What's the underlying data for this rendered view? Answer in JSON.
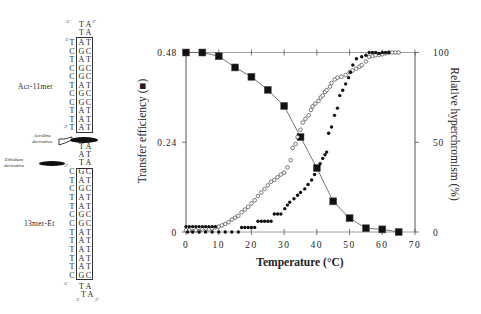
{
  "schematic": {
    "acr_label": "Acr-11mer",
    "et_label": "13mer-Et",
    "acridine_label": [
      "Acridine",
      "derivative"
    ],
    "ethidium_label": [
      "Ethidium",
      "derivative"
    ],
    "prime5": "5'",
    "prime3": "3'",
    "acr_top": [
      [
        "T",
        "A"
      ],
      [
        "T",
        "A"
      ]
    ],
    "acr_rows": [
      [
        "T",
        "A",
        "T"
      ],
      [
        "C",
        "G",
        "C"
      ],
      [
        "T",
        "A",
        "T"
      ],
      [
        "C",
        "G",
        "C"
      ],
      [
        "C",
        "G",
        "C"
      ],
      [
        "T",
        "A",
        "T"
      ],
      [
        "C",
        "G",
        "C"
      ],
      [
        "C",
        "G",
        "C"
      ],
      [
        "T",
        "A",
        "T"
      ],
      [
        "T",
        "A",
        "T"
      ],
      [
        "T",
        "A",
        "T"
      ]
    ],
    "linker": [
      [
        "T",
        "A"
      ],
      [
        "A",
        "T"
      ],
      [
        "T",
        "A"
      ]
    ],
    "et_rows": [
      [
        "C",
        "G",
        "C"
      ],
      [
        "T",
        "A",
        "T"
      ],
      [
        "C",
        "G",
        "C"
      ],
      [
        "T",
        "A",
        "T"
      ],
      [
        "T",
        "A",
        "T"
      ],
      [
        "C",
        "G",
        "C"
      ],
      [
        "C",
        "G",
        "C"
      ],
      [
        "T",
        "A",
        "T"
      ],
      [
        "T",
        "A",
        "T"
      ],
      [
        "T",
        "A",
        "T"
      ],
      [
        "T",
        "A",
        "T"
      ],
      [
        "T",
        "A",
        "T"
      ],
      [
        "C",
        "G",
        "C"
      ]
    ],
    "et_bottom": [
      [
        "T",
        "A"
      ],
      [
        "T",
        "A"
      ]
    ]
  },
  "chart_data": {
    "type": "scatter",
    "title": "",
    "xlabel": "Temperature (°C)",
    "ylabel_left": "Transfer efficiency (■)",
    "ylabel_right": "Relative hyperchromism (%)",
    "xlim": [
      0,
      70
    ],
    "xticks": [
      0,
      10,
      20,
      30,
      40,
      50,
      60,
      70
    ],
    "ylim_left": [
      0,
      0.48
    ],
    "yticks_left": [
      0,
      0.24,
      0.48
    ],
    "yticks_left_labels": [
      "0",
      "0.24",
      "0.48"
    ],
    "ylim_right": [
      0,
      100
    ],
    "yticks_right": [
      0,
      50,
      100
    ],
    "grid": false,
    "series": [
      {
        "name": "Transfer efficiency",
        "marker": "filled-square",
        "axis": "left",
        "line": true,
        "x": [
          0,
          5,
          10,
          15,
          20,
          25,
          30,
          35,
          40,
          45,
          50,
          55,
          60,
          65
        ],
        "y": [
          0.48,
          0.48,
          0.47,
          0.44,
          0.415,
          0.38,
          0.337,
          0.254,
          0.171,
          0.082,
          0.037,
          0.01,
          0.007,
          0.0
        ]
      },
      {
        "name": "Relative hyperchromism (open circles)",
        "marker": "open-circle",
        "axis": "right",
        "line": false,
        "points": [
          [
            0,
            1
          ],
          [
            1,
            1
          ],
          [
            2,
            0.5
          ],
          [
            3,
            1
          ],
          [
            4,
            0.5
          ],
          [
            5,
            1.5
          ],
          [
            6,
            2
          ],
          [
            7,
            1.5
          ],
          [
            8,
            2
          ],
          [
            9,
            2.5
          ],
          [
            10,
            3
          ],
          [
            11,
            3.7
          ],
          [
            12,
            4.5
          ],
          [
            13,
            5.5
          ],
          [
            14,
            7
          ],
          [
            15,
            8
          ],
          [
            16,
            9
          ],
          [
            17,
            11
          ],
          [
            18,
            12.5
          ],
          [
            19,
            14
          ],
          [
            20,
            16
          ],
          [
            21,
            17.7
          ],
          [
            22,
            20
          ],
          [
            23,
            22
          ],
          [
            24,
            24
          ],
          [
            25,
            26
          ],
          [
            26,
            28
          ],
          [
            27,
            29
          ],
          [
            28,
            30.5
          ],
          [
            29,
            32
          ],
          [
            30,
            33
          ],
          [
            31,
            36
          ],
          [
            32,
            40
          ],
          [
            32.6,
            46.8
          ],
          [
            33.5,
            49
          ],
          [
            34.1,
            52.9
          ],
          [
            35,
            57
          ],
          [
            35.7,
            61
          ],
          [
            36.5,
            63
          ],
          [
            37.5,
            65
          ],
          [
            38.2,
            68
          ],
          [
            38.7,
            70
          ],
          [
            39.5,
            71.5
          ],
          [
            40.5,
            73
          ],
          [
            41.2,
            75
          ],
          [
            41.8,
            76
          ],
          [
            42.5,
            78
          ],
          [
            43,
            79
          ],
          [
            44,
            81
          ],
          [
            44.5,
            83
          ],
          [
            45.5,
            85
          ],
          [
            46.3,
            86
          ],
          [
            47.5,
            86.5
          ],
          [
            48.8,
            87.5
          ],
          [
            50,
            89
          ],
          [
            50.9,
            90
          ],
          [
            52,
            91
          ],
          [
            53,
            92
          ],
          [
            53.7,
            93
          ],
          [
            55,
            95
          ],
          [
            56,
            97.6
          ],
          [
            57,
            98
          ],
          [
            58,
            98.5
          ],
          [
            59,
            98.7
          ],
          [
            60,
            99
          ],
          [
            61,
            99.5
          ],
          [
            62,
            100
          ],
          [
            63,
            100
          ],
          [
            64,
            100
          ],
          [
            65,
            100
          ]
        ]
      },
      {
        "name": "Relative hyperchromism (filled circles)",
        "marker": "filled-circle",
        "axis": "right",
        "line": false,
        "points": [
          [
            0,
            3
          ],
          [
            1,
            3
          ],
          [
            2,
            3
          ],
          [
            3,
            3
          ],
          [
            4,
            3
          ],
          [
            5,
            3
          ],
          [
            6,
            3
          ],
          [
            7,
            3
          ],
          [
            8,
            3
          ],
          [
            9,
            3
          ],
          [
            0.5,
            0
          ],
          [
            2,
            0
          ],
          [
            4,
            0
          ],
          [
            6,
            0
          ],
          [
            8,
            0
          ],
          [
            10,
            0
          ],
          [
            12,
            0
          ],
          [
            14,
            0
          ],
          [
            16,
            0
          ],
          [
            17,
            2.5
          ],
          [
            18,
            2.5
          ],
          [
            19,
            2.5
          ],
          [
            20,
            2.5
          ],
          [
            21,
            2.5
          ],
          [
            22,
            6
          ],
          [
            23,
            6
          ],
          [
            24,
            6
          ],
          [
            25,
            6
          ],
          [
            26,
            6
          ],
          [
            27,
            10
          ],
          [
            28,
            10
          ],
          [
            29,
            10
          ],
          [
            30.2,
            13
          ],
          [
            31,
            15
          ],
          [
            31.7,
            16.6
          ],
          [
            33,
            18.5
          ],
          [
            34.1,
            20.5
          ],
          [
            35,
            22
          ],
          [
            36.3,
            24
          ],
          [
            37.3,
            26.5
          ],
          [
            38.4,
            29
          ],
          [
            39.3,
            32
          ],
          [
            40.2,
            35.6
          ],
          [
            41,
            38
          ],
          [
            41.8,
            41
          ],
          [
            42.5,
            43
          ],
          [
            43,
            44.5
          ],
          [
            43.6,
            55
          ],
          [
            44.5,
            58.5
          ],
          [
            45.4,
            65
          ],
          [
            46.3,
            69
          ],
          [
            47,
            76
          ],
          [
            47.9,
            79
          ],
          [
            48.8,
            82.5
          ],
          [
            49.7,
            86
          ],
          [
            50.3,
            89
          ],
          [
            51,
            93
          ],
          [
            52.1,
            96.5
          ],
          [
            53.7,
            97.6
          ],
          [
            55,
            98.5
          ],
          [
            56,
            100
          ],
          [
            57,
            100
          ],
          [
            58,
            100
          ],
          [
            59,
            99.5
          ],
          [
            60,
            100
          ],
          [
            61,
            100
          ],
          [
            62,
            100
          ]
        ]
      }
    ]
  }
}
